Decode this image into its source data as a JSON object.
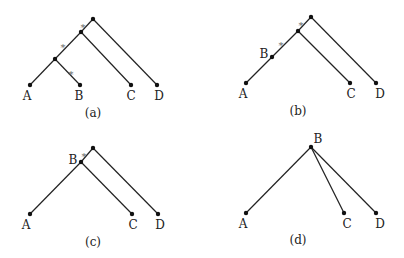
{
  "figure": {
    "panels": [
      {
        "id": "a",
        "caption": "(a)",
        "caption_pos": [
          93,
          117
        ],
        "nodes": [
          {
            "id": "r",
            "x": 93,
            "y": 19
          },
          {
            "id": "n1",
            "x": 81,
            "y": 32
          },
          {
            "id": "n2",
            "x": 55,
            "y": 59
          },
          {
            "id": "A",
            "x": 30,
            "y": 85,
            "label": "A",
            "lx": 27,
            "ly": 100
          },
          {
            "id": "B",
            "x": 80,
            "y": 85,
            "label": "B",
            "lx": 79,
            "ly": 100
          },
          {
            "id": "C",
            "x": 131,
            "y": 85,
            "label": "C",
            "lx": 131,
            "ly": 100
          },
          {
            "id": "D",
            "x": 157,
            "y": 85,
            "label": "D",
            "lx": 159,
            "ly": 100
          }
        ],
        "edges": [
          [
            "r",
            "n1"
          ],
          [
            "r",
            "D"
          ],
          [
            "n1",
            "n2"
          ],
          [
            "n1",
            "C"
          ],
          [
            "n2",
            "A"
          ],
          [
            "n2",
            "B"
          ]
        ],
        "stars": [
          {
            "x": 83,
            "y": 26
          },
          {
            "x": 63,
            "y": 46
          },
          {
            "x": 71,
            "y": 73
          }
        ]
      },
      {
        "id": "b",
        "caption": "(b)",
        "caption_pos": [
          298,
          115
        ],
        "nodes": [
          {
            "id": "r",
            "x": 311,
            "y": 17
          },
          {
            "id": "n1",
            "x": 298,
            "y": 31
          },
          {
            "id": "B",
            "x": 272,
            "y": 57,
            "label": "B",
            "lx": 264,
            "ly": 58
          },
          {
            "id": "A",
            "x": 246,
            "y": 83,
            "label": "A",
            "lx": 243,
            "ly": 98
          },
          {
            "id": "C",
            "x": 350,
            "y": 83,
            "label": "C",
            "lx": 351,
            "ly": 98
          },
          {
            "id": "D",
            "x": 376,
            "y": 83,
            "label": "D",
            "lx": 380,
            "ly": 98
          }
        ],
        "edges": [
          [
            "r",
            "n1"
          ],
          [
            "r",
            "D"
          ],
          [
            "n1",
            "B"
          ],
          [
            "n1",
            "C"
          ],
          [
            "B",
            "A"
          ]
        ],
        "stars": [
          {
            "x": 301,
            "y": 24
          },
          {
            "x": 281,
            "y": 44
          }
        ]
      },
      {
        "id": "c",
        "caption": "(c)",
        "caption_pos": [
          93,
          246
        ],
        "nodes": [
          {
            "id": "r",
            "x": 93,
            "y": 148
          },
          {
            "id": "B",
            "x": 81,
            "y": 162,
            "label": "B",
            "lx": 73,
            "ly": 164
          },
          {
            "id": "A",
            "x": 30,
            "y": 214,
            "label": "A",
            "lx": 26,
            "ly": 229
          },
          {
            "id": "C",
            "x": 132,
            "y": 214,
            "label": "C",
            "lx": 133,
            "ly": 229
          },
          {
            "id": "D",
            "x": 158,
            "y": 214,
            "label": "D",
            "lx": 160,
            "ly": 229
          }
        ],
        "edges": [
          [
            "r",
            "B"
          ],
          [
            "r",
            "D"
          ],
          [
            "B",
            "A"
          ],
          [
            "B",
            "C"
          ]
        ],
        "stars": [
          {
            "x": 84,
            "y": 155
          }
        ]
      },
      {
        "id": "d",
        "caption": "(d)",
        "caption_pos": [
          298,
          244
        ],
        "nodes": [
          {
            "id": "B",
            "x": 311,
            "y": 147,
            "label": "B",
            "lx": 318,
            "ly": 143
          },
          {
            "id": "A",
            "x": 246,
            "y": 213,
            "label": "A",
            "lx": 243,
            "ly": 228
          },
          {
            "id": "C",
            "x": 344,
            "y": 213,
            "label": "C",
            "lx": 347,
            "ly": 228
          },
          {
            "id": "D",
            "x": 376,
            "y": 213,
            "label": "D",
            "lx": 380,
            "ly": 228
          }
        ],
        "edges": [
          [
            "B",
            "A"
          ],
          [
            "B",
            "C"
          ],
          [
            "B",
            "D"
          ]
        ],
        "stars": []
      }
    ],
    "star_glyph": "*"
  }
}
